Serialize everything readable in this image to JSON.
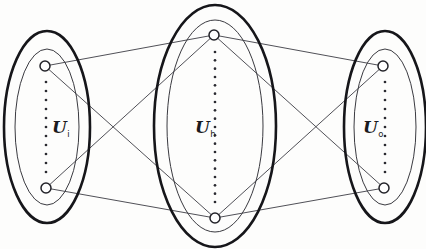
{
  "figure": {
    "background_color": "#fdfdfc",
    "width": 426,
    "height": 249
  },
  "style": {
    "outer_ellipse_color": "#16161a",
    "inner_ellipse_color": "#3a3a40",
    "edge_color": "#3c3c44",
    "node_fill": "#ffffff",
    "node_stroke": "#232329",
    "dot_color": "#2a2a30"
  },
  "chart_data": {
    "type": "diagram",
    "title": "",
    "layers": [
      {
        "id": "input",
        "label_base": "U",
        "label_sub": "i",
        "label_full": "U i",
        "center_x": 47,
        "center_y": 127,
        "outer_rx": 43,
        "outer_ry": 96,
        "inner_rx": 32,
        "inner_ry": 78,
        "label_x": 52,
        "label_y": 133,
        "dots_x": 46,
        "dots_top": 82,
        "dots_bottom": 172,
        "dot_count": 11,
        "nodes": [
          {
            "id": "i-top",
            "x": 45,
            "y": 66,
            "r": 5
          },
          {
            "id": "i-bottom",
            "x": 46,
            "y": 188,
            "r": 5
          }
        ]
      },
      {
        "id": "hidden",
        "label_base": "U",
        "label_sub": "h",
        "label_full": "U h",
        "center_x": 215,
        "center_y": 126,
        "outer_rx": 61,
        "outer_ry": 121,
        "inner_rx": 48,
        "inner_ry": 106,
        "label_x": 195,
        "label_y": 133,
        "dots_x": 215,
        "dots_top": 52,
        "dots_bottom": 202,
        "dot_count": 19,
        "nodes": [
          {
            "id": "h-top",
            "x": 214,
            "y": 35,
            "r": 5
          },
          {
            "id": "h-bottom",
            "x": 215,
            "y": 218,
            "r": 5
          }
        ]
      },
      {
        "id": "output",
        "label_base": "U",
        "label_sub": "o",
        "label_full": "U o",
        "center_x": 385,
        "center_y": 127,
        "outer_rx": 41,
        "outer_ry": 96,
        "inner_rx": 31,
        "inner_ry": 78,
        "label_x": 363,
        "label_y": 133,
        "dots_x": 385,
        "dots_top": 82,
        "dots_bottom": 172,
        "dot_count": 11,
        "nodes": [
          {
            "id": "o-top",
            "x": 383,
            "y": 66,
            "r": 5
          },
          {
            "id": "o-bottom",
            "x": 384,
            "y": 188,
            "r": 5
          }
        ]
      }
    ],
    "edges": [
      {
        "from": "i-top",
        "to": "h-top",
        "x1": 45,
        "y1": 66,
        "x2": 214,
        "y2": 35
      },
      {
        "from": "i-top",
        "to": "h-bottom",
        "x1": 45,
        "y1": 66,
        "x2": 215,
        "y2": 218
      },
      {
        "from": "i-bottom",
        "to": "h-top",
        "x1": 46,
        "y1": 188,
        "x2": 214,
        "y2": 35
      },
      {
        "from": "i-bottom",
        "to": "h-bottom",
        "x1": 46,
        "y1": 188,
        "x2": 215,
        "y2": 218
      },
      {
        "from": "h-top",
        "to": "o-top",
        "x1": 214,
        "y1": 35,
        "x2": 383,
        "y2": 66
      },
      {
        "from": "h-top",
        "to": "o-bottom",
        "x1": 214,
        "y1": 35,
        "x2": 384,
        "y2": 188
      },
      {
        "from": "h-bottom",
        "to": "o-top",
        "x1": 215,
        "y1": 218,
        "x2": 383,
        "y2": 66
      },
      {
        "from": "h-bottom",
        "to": "o-bottom",
        "x1": 215,
        "y1": 218,
        "x2": 384,
        "y2": 188
      }
    ],
    "edge_count": 8,
    "node_count": 6,
    "layer_count": 3,
    "connectivity": "fully-connected bipartite between adjacent layers"
  }
}
